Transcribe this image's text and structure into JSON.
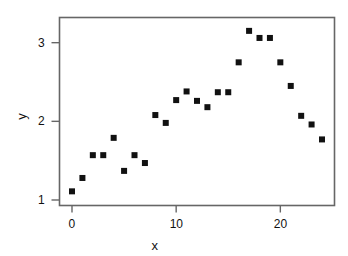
{
  "chart_data": {
    "type": "scatter",
    "title": "",
    "xlabel": "x",
    "ylabel": "y",
    "xlim": [
      -1.2,
      25.2
    ],
    "ylim": [
      0.93,
      3.32
    ],
    "xticks": [
      0,
      10,
      20
    ],
    "xticklabels": [
      "0",
      "10",
      "20"
    ],
    "yticks": [
      1,
      2,
      3
    ],
    "yticklabels": [
      "1",
      "2",
      "3"
    ],
    "grid": false,
    "legend": null,
    "marker": "square",
    "marker_color": "#111111",
    "marker_size_px": 6,
    "frame": true,
    "frame_color": "#666666",
    "points": [
      {
        "x": 0,
        "y": 1.11
      },
      {
        "x": 1,
        "y": 1.28
      },
      {
        "x": 2,
        "y": 1.57
      },
      {
        "x": 3,
        "y": 1.57
      },
      {
        "x": 4,
        "y": 1.79
      },
      {
        "x": 5,
        "y": 1.37
      },
      {
        "x": 6,
        "y": 1.57
      },
      {
        "x": 7,
        "y": 1.47
      },
      {
        "x": 8,
        "y": 2.08
      },
      {
        "x": 9,
        "y": 1.98
      },
      {
        "x": 10,
        "y": 2.27
      },
      {
        "x": 11,
        "y": 2.38
      },
      {
        "x": 12,
        "y": 2.26
      },
      {
        "x": 13,
        "y": 2.18
      },
      {
        "x": 14,
        "y": 2.37
      },
      {
        "x": 15,
        "y": 2.37
      },
      {
        "x": 16,
        "y": 2.75
      },
      {
        "x": 17,
        "y": 3.15
      },
      {
        "x": 18,
        "y": 3.06
      },
      {
        "x": 19,
        "y": 3.06
      },
      {
        "x": 20,
        "y": 2.75
      },
      {
        "x": 21,
        "y": 2.45
      },
      {
        "x": 22,
        "y": 2.07
      },
      {
        "x": 23,
        "y": 1.96
      },
      {
        "x": 24,
        "y": 1.77
      }
    ]
  },
  "axes": {
    "xlabel": "x",
    "ylabel": "y",
    "xticklabels": [
      "0",
      "10",
      "20"
    ],
    "yticklabels": [
      "1",
      "2",
      "3"
    ]
  }
}
